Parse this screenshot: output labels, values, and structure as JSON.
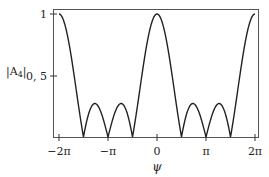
{
  "chart_data": {
    "type": "line",
    "title": "",
    "xlabel": "ψ",
    "ylabel": "|A₄|",
    "xlim": [
      -6.2832,
      6.2832
    ],
    "ylim": [
      0,
      1.03
    ],
    "x_ticks": [
      "−2π",
      "−π",
      "0",
      "π",
      "2π"
    ],
    "y_ticks": [
      "0.5",
      "1"
    ],
    "grid": false,
    "legend": null,
    "function": "|sin(2ψ) / (4 sin(ψ/2))|",
    "series": [
      {
        "name": "|A4|",
        "x": [
          -6.2832,
          -5.8905,
          -5.4978,
          -5.1051,
          -4.7124,
          -4.3197,
          -3.927,
          -3.5343,
          -3.1416,
          -2.7489,
          -2.3562,
          -1.9635,
          -1.5708,
          -1.1781,
          -0.7854,
          -0.3927,
          0,
          0.3927,
          0.7854,
          1.1781,
          1.5708,
          1.9635,
          2.3562,
          2.7489,
          3.1416,
          3.5343,
          3.927,
          4.3197,
          4.7124,
          5.1051,
          5.4978,
          5.8905,
          6.2832
        ],
        "values": [
          1.0,
          0.9,
          0.65,
          0.33,
          0.0,
          0.19,
          0.27,
          0.18,
          0.0,
          0.18,
          0.27,
          0.19,
          0.0,
          0.33,
          0.65,
          0.9,
          1.0,
          0.9,
          0.65,
          0.33,
          0.0,
          0.19,
          0.27,
          0.18,
          0.0,
          0.18,
          0.27,
          0.19,
          0.0,
          0.33,
          0.65,
          0.9,
          1.0
        ]
      }
    ]
  },
  "labels": {
    "ylabel": "|A",
    "ylabel_sub": "4",
    "ylabel_end": "|",
    "xlabel": "ψ",
    "xticks": [
      "−2π",
      "−π",
      "0",
      "π",
      "2π"
    ],
    "yticks": [
      "1",
      "0, 5"
    ]
  }
}
